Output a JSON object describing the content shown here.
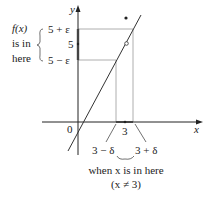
{
  "diagram": {
    "axis_labels": {
      "x": "x",
      "y": "y",
      "origin": "0"
    },
    "y_ticks": {
      "upper": "5 + ε",
      "center": "5",
      "lower": "5 − ε"
    },
    "x_ticks": {
      "center": "3",
      "left": "3 − δ",
      "right": "3 + δ"
    },
    "left_annotation": {
      "line1": "f(x)",
      "line2": "is in",
      "line3": "here"
    },
    "bottom_annotation": {
      "line1": "when x is in here",
      "line2": "(x ≠ 3)"
    },
    "colors": {
      "axis": "#222222",
      "guide": "#9a9a9a",
      "curve": "#333333",
      "highlight": "#444444"
    }
  }
}
